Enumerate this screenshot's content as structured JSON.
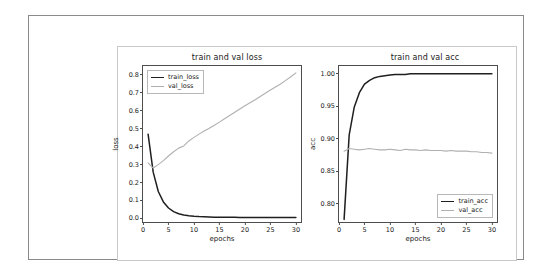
{
  "figure": {
    "background_color": "#ffffff",
    "frame_color": "#8a8a8a"
  },
  "panels": [
    {
      "key": "loss",
      "title": "train and val loss",
      "xlabel": "epochs",
      "ylabel": "loss",
      "legend_position": "upper left",
      "legend": [
        {
          "label": "train_loss",
          "color": "#1f1f1f"
        },
        {
          "label": "val_loss",
          "color": "#b0b0b0"
        }
      ],
      "yticks": [
        "0.0",
        "0.1",
        "0.2",
        "0.3",
        "0.4",
        "0.5",
        "0.6",
        "0.7",
        "0.8"
      ],
      "xticks": [
        "0",
        "5",
        "10",
        "15",
        "20",
        "25",
        "30"
      ]
    },
    {
      "key": "acc",
      "title": "train and val acc",
      "xlabel": "epochs",
      "ylabel": "acc",
      "legend_position": "lower right",
      "legend": [
        {
          "label": "train_acc",
          "color": "#1f1f1f"
        },
        {
          "label": "val_acc",
          "color": "#b0b0b0"
        }
      ],
      "yticks": [
        "0.80",
        "0.85",
        "0.90",
        "0.95",
        "1.00"
      ],
      "xticks": [
        "0",
        "5",
        "10",
        "15",
        "20",
        "25",
        "30"
      ]
    }
  ],
  "chart_data": [
    {
      "type": "line",
      "title": "train and val loss",
      "xlabel": "epochs",
      "ylabel": "loss",
      "xlim": [
        0.0,
        31.0
      ],
      "ylim": [
        -0.02,
        0.85
      ],
      "xticks": [
        0,
        5,
        10,
        15,
        20,
        25,
        30
      ],
      "yticks": [
        0.0,
        0.1,
        0.2,
        0.3,
        0.4,
        0.5,
        0.6,
        0.7,
        0.8
      ],
      "grid": false,
      "legend_position": "upper left",
      "x": [
        1,
        2,
        3,
        4,
        5,
        6,
        7,
        8,
        9,
        10,
        11,
        12,
        13,
        14,
        15,
        16,
        17,
        18,
        19,
        20,
        21,
        22,
        23,
        24,
        25,
        26,
        27,
        28,
        29,
        30
      ],
      "series": [
        {
          "name": "train_loss",
          "color": "#1f1f1f",
          "values": [
            0.47,
            0.258,
            0.15,
            0.092,
            0.058,
            0.038,
            0.026,
            0.019,
            0.015,
            0.012,
            0.01,
            0.009,
            0.008,
            0.007,
            0.007,
            0.006,
            0.006,
            0.006,
            0.005,
            0.005,
            0.005,
            0.005,
            0.005,
            0.005,
            0.005,
            0.005,
            0.005,
            0.005,
            0.005,
            0.005
          ]
        },
        {
          "name": "val_loss",
          "color": "#b0b0b0",
          "values": [
            0.31,
            0.281,
            0.3,
            0.322,
            0.348,
            0.372,
            0.392,
            0.404,
            0.432,
            0.452,
            0.47,
            0.487,
            0.503,
            0.52,
            0.537,
            0.556,
            0.574,
            0.592,
            0.61,
            0.628,
            0.645,
            0.662,
            0.68,
            0.698,
            0.716,
            0.733,
            0.75,
            0.77,
            0.79,
            0.812
          ]
        }
      ]
    },
    {
      "type": "line",
      "title": "train and val acc",
      "xlabel": "epochs",
      "ylabel": "acc",
      "xlim": [
        0.0,
        31.0
      ],
      "ylim": [
        0.772,
        1.012
      ],
      "xticks": [
        0,
        5,
        10,
        15,
        20,
        25,
        30
      ],
      "yticks": [
        0.8,
        0.85,
        0.9,
        0.95,
        1.0
      ],
      "grid": false,
      "legend_position": "lower right",
      "x": [
        1,
        2,
        3,
        4,
        5,
        6,
        7,
        8,
        9,
        10,
        11,
        12,
        13,
        14,
        15,
        16,
        17,
        18,
        19,
        20,
        21,
        22,
        23,
        24,
        25,
        26,
        27,
        28,
        29,
        30
      ],
      "series": [
        {
          "name": "train_acc",
          "color": "#1f1f1f",
          "values": [
            0.776,
            0.906,
            0.949,
            0.971,
            0.984,
            0.99,
            0.994,
            0.996,
            0.997,
            0.998,
            0.999,
            0.999,
            0.999,
            1.0,
            1.0,
            1.0,
            1.0,
            1.0,
            1.0,
            1.0,
            1.0,
            1.0,
            1.0,
            1.0,
            1.0,
            1.0,
            1.0,
            1.0,
            1.0,
            1.0
          ]
        },
        {
          "name": "val_acc",
          "color": "#b0b0b0",
          "values": [
            0.881,
            0.885,
            0.884,
            0.883,
            0.884,
            0.885,
            0.884,
            0.883,
            0.883,
            0.884,
            0.883,
            0.882,
            0.884,
            0.883,
            0.883,
            0.882,
            0.883,
            0.882,
            0.882,
            0.882,
            0.881,
            0.882,
            0.881,
            0.881,
            0.881,
            0.88,
            0.88,
            0.879,
            0.879,
            0.878
          ]
        }
      ]
    }
  ]
}
